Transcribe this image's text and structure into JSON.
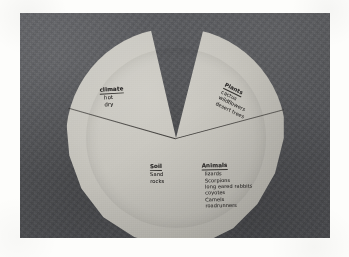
{
  "scene": {
    "kind": "photograph",
    "subject": "hand-drawn paper plate pie chart of a desert ecosystem",
    "background_color": "#55565a",
    "page_color": "#fdfdfb",
    "plate_color": "#c6c4bd",
    "ink_color": "#2e2c2b"
  },
  "chart_data": {
    "type": "pie",
    "title": "",
    "categories": [
      "Climate",
      "Plants",
      "Soil / Animals"
    ],
    "values": [
      30,
      25,
      45
    ],
    "legend_position": "none",
    "grid": false,
    "note": "wedge cut away at top of plate between the Climate and Plants slices"
  },
  "labels": {
    "climate": {
      "heading": "climate",
      "items": [
        "hot",
        "dry"
      ]
    },
    "plants": {
      "heading": "Plants",
      "items": [
        "cactus",
        "wildflowers",
        "desert trees"
      ]
    },
    "soil": {
      "heading": "Soil",
      "items": [
        "Sand",
        "rocks"
      ]
    },
    "animals": {
      "heading": "Animals",
      "items": [
        "lizards",
        "Scorpions",
        "long eared rabbits",
        "coyotes",
        "Camels",
        "roadrunners"
      ]
    }
  }
}
